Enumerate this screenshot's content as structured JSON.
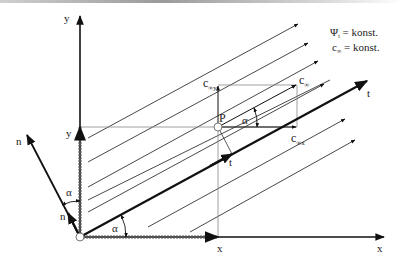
{
  "diagram": {
    "title_lines": [
      {
        "symbol": "Ψ",
        "sub": "t",
        "text": " = konst."
      },
      {
        "symbol": "c",
        "sub": "∞",
        "text": " = konst."
      }
    ],
    "axes": {
      "x_label": "x",
      "y_label": "y",
      "n_label": "n",
      "t_label": "t"
    },
    "point": {
      "label": "P",
      "x_label": "x",
      "y_label": "y"
    },
    "vectors": {
      "c_inf": {
        "main": "c",
        "sub": "∞"
      },
      "c_inf_x": {
        "main": "c",
        "sub": "∞x"
      },
      "c_inf_y": {
        "main": "c",
        "sub": "∞y"
      }
    },
    "unit_vectors": {
      "t": "t",
      "n": "n"
    },
    "angle_label": "α",
    "colors": {
      "line": "#1a1a1a",
      "thin": "#333333",
      "grid": "#888888"
    }
  }
}
